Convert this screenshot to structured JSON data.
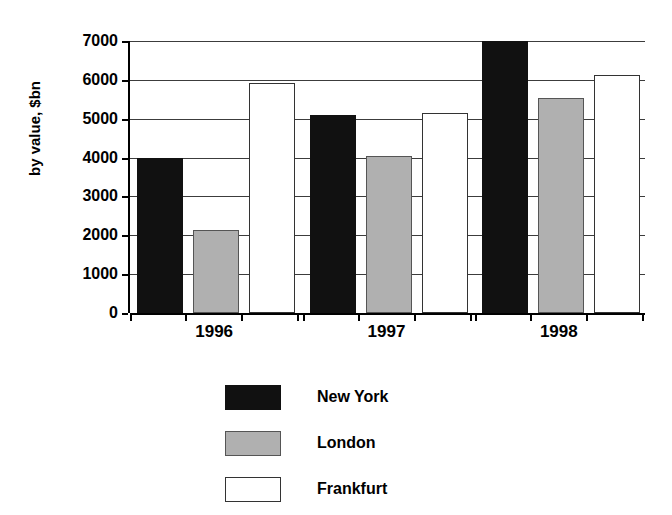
{
  "chart_data": {
    "type": "bar",
    "title": "",
    "subtitle": "",
    "xlabel": "",
    "ylabel": "by value, $bn",
    "categories": [
      "1996",
      "1997",
      "1998"
    ],
    "series": [
      {
        "name": "New York",
        "color": "#111111",
        "values": [
          4000,
          5100,
          7000
        ]
      },
      {
        "name": "London",
        "color": "#b0b0b0",
        "values": [
          2130,
          4050,
          5530
        ]
      },
      {
        "name": "Frankfurt",
        "color": "#ffffff",
        "values": [
          5920,
          5150,
          6130
        ]
      }
    ],
    "ylim": [
      0,
      7000
    ],
    "ytick_values": [
      0,
      1000,
      2000,
      3000,
      4000,
      5000,
      6000,
      7000
    ],
    "ytick_labels": [
      "0",
      "1000",
      "2000",
      "3000",
      "4000",
      "5000",
      "6000",
      "7000"
    ],
    "grid": true,
    "grid_axis": "y",
    "legend_position": "bottom-center",
    "legend_entries": [
      "New York",
      "London",
      "Frankfurt"
    ],
    "annotations": []
  },
  "axes": {
    "y_title": "by value, $bn"
  },
  "legend": {
    "items": [
      {
        "label": "New York"
      },
      {
        "label": "London"
      },
      {
        "label": "Frankfurt"
      }
    ]
  }
}
